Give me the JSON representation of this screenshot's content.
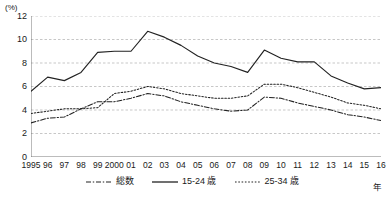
{
  "chart_data": {
    "type": "line",
    "title": "",
    "subtitle": "",
    "xlabel": "年",
    "ylabel": "(%)",
    "ylim": [
      0,
      12
    ],
    "y_ticks": [
      0,
      2,
      4,
      6,
      8,
      10,
      12
    ],
    "grid": true,
    "grid_axis": "y",
    "legend_position": "bottom-center",
    "categories": [
      "1995",
      "96",
      "97",
      "98",
      "99",
      "2000",
      "01",
      "02",
      "03",
      "04",
      "05",
      "06",
      "07",
      "08",
      "09",
      "10",
      "11",
      "12",
      "13",
      "14",
      "15",
      "16"
    ],
    "x": [
      1995,
      1996,
      1997,
      1998,
      1999,
      2000,
      2001,
      2002,
      2003,
      2004,
      2005,
      2006,
      2007,
      2008,
      2009,
      2010,
      2011,
      2012,
      2013,
      2014,
      2015,
      2016
    ],
    "series": [
      {
        "name": "総数",
        "style": "dash-dot",
        "color": "#222222",
        "values": [
          2.9,
          3.3,
          3.4,
          4.1,
          4.7,
          4.7,
          5.0,
          5.4,
          5.2,
          4.7,
          4.4,
          4.1,
          3.9,
          4.0,
          5.1,
          5.0,
          4.6,
          4.3,
          4.0,
          3.6,
          3.4,
          3.1
        ]
      },
      {
        "name": "15-24 歳",
        "style": "solid",
        "color": "#222222",
        "values": [
          5.6,
          6.8,
          6.5,
          7.2,
          8.9,
          9.0,
          9.0,
          10.7,
          10.2,
          9.5,
          8.6,
          8.0,
          7.7,
          7.2,
          9.1,
          8.4,
          8.1,
          8.1,
          6.9,
          6.3,
          5.8,
          5.9
        ]
      },
      {
        "name": "25-34 歳",
        "style": "dotted",
        "color": "#222222",
        "values": [
          3.7,
          3.9,
          4.1,
          4.1,
          4.2,
          5.4,
          5.6,
          6.0,
          5.8,
          5.4,
          5.2,
          5.0,
          5.0,
          5.2,
          6.2,
          6.2,
          5.9,
          5.5,
          5.1,
          4.6,
          4.4,
          4.1
        ]
      }
    ]
  },
  "axis": {
    "unit": "(%)",
    "x_unit": "年"
  }
}
